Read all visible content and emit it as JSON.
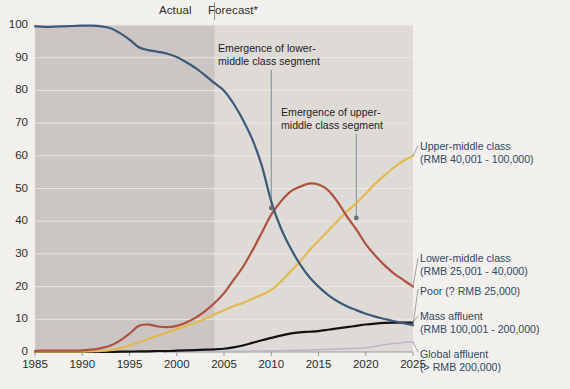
{
  "header": {
    "actual_label": "Actual",
    "forecast_label": "Forecast*"
  },
  "annotations": [
    {
      "id": "lower",
      "line1": "Emergence of lower-",
      "line2": "middle class segment"
    },
    {
      "id": "upper",
      "line1": "Emergence of upper-",
      "line2": "middle class segment"
    }
  ],
  "legend": {
    "upper_middle_l1": "Upper-middle class",
    "upper_middle_l2": "(RMB 40,001 - 100,000)",
    "lower_middle_l1": "Lower-middle class",
    "lower_middle_l2": "(RMB 25,001 - 40,000)",
    "poor_l1": "Poor (? RMB 25,000)",
    "mass_affluent_l1": "Mass affluent",
    "mass_affluent_l2": "(RMB 100,001 - 200,000)",
    "global_affluent_l1": "Global affluent",
    "global_affluent_l2": "(> RMB 200,000)"
  },
  "colors": {
    "poor": "#3c5a78",
    "lower_middle": "#b0503f",
    "upper_middle": "#e3b94e",
    "mass_affluent": "#121212",
    "global_affluent": "#b9b8c8",
    "page_bg": "#f2f0ec",
    "plot_bg": "#dedbd7",
    "actual_bg": "#cbc6c4",
    "grid": "#efece8"
  },
  "chart_data": {
    "type": "line",
    "title": "",
    "subtitle": "",
    "xlabel": "",
    "ylabel": "",
    "xlim": [
      1985,
      2025
    ],
    "ylim": [
      0,
      100
    ],
    "grid": true,
    "legend_position": "right",
    "xticks": [
      1985,
      1990,
      1995,
      2000,
      2005,
      2010,
      2015,
      2020,
      2025
    ],
    "yticks": [
      0,
      10,
      20,
      30,
      40,
      50,
      60,
      70,
      80,
      90,
      100
    ],
    "actual_forecast_split": 2004,
    "x": [
      1985,
      1986,
      1987,
      1988,
      1989,
      1990,
      1991,
      1992,
      1993,
      1994,
      1995,
      1996,
      1997,
      1998,
      1999,
      2000,
      2001,
      2002,
      2003,
      2004,
      2005,
      2006,
      2007,
      2008,
      2009,
      2010,
      2011,
      2012,
      2013,
      2014,
      2015,
      2016,
      2017,
      2018,
      2019,
      2020,
      2021,
      2022,
      2023,
      2024,
      2025
    ],
    "series": [
      {
        "name": "Poor (? RMB 25,000)",
        "color": "#3c5a78",
        "values": [
          99.6,
          99.4,
          99.5,
          99.6,
          99.7,
          99.8,
          99.8,
          99.6,
          99.0,
          97.5,
          95.5,
          93.2,
          92.3,
          91.8,
          91.2,
          90.2,
          88.6,
          86.8,
          84.6,
          82.2,
          79.9,
          76.0,
          71.0,
          65.0,
          57.0,
          46.0,
          38.0,
          32.0,
          27.0,
          23.0,
          20.0,
          17.5,
          15.5,
          14.0,
          12.8,
          11.7,
          10.8,
          10.1,
          9.4,
          8.8,
          8.2
        ]
      },
      {
        "name": "Lower-middle class (RMB 25,001 - 40,000)",
        "color": "#b0503f",
        "values": [
          0.3,
          0.4,
          0.4,
          0.4,
          0.4,
          0.5,
          0.7,
          1.2,
          2.0,
          3.5,
          5.6,
          8.0,
          8.4,
          7.8,
          7.6,
          8.0,
          9.0,
          10.5,
          12.5,
          15.0,
          18.0,
          22.0,
          26.0,
          31.0,
          36.5,
          42.0,
          46.0,
          49.0,
          50.5,
          51.5,
          51.2,
          49.5,
          46.0,
          41.5,
          37.5,
          33.0,
          29.5,
          26.5,
          24.0,
          22.0,
          20.0
        ]
      },
      {
        "name": "Upper-middle class (RMB 40,001 - 100,000)",
        "color": "#e3b94e",
        "values": [
          0.1,
          0.1,
          0.1,
          0.1,
          0.1,
          0.1,
          0.2,
          0.3,
          0.6,
          1.2,
          2.0,
          3.0,
          4.0,
          5.0,
          6.0,
          7.0,
          8.0,
          9.0,
          10.2,
          11.5,
          12.8,
          14.0,
          15.0,
          16.3,
          17.5,
          19.0,
          21.5,
          24.5,
          27.5,
          31.0,
          34.0,
          37.0,
          40.0,
          43.0,
          45.5,
          48.5,
          51.5,
          54.0,
          56.5,
          58.5,
          60.0
        ]
      },
      {
        "name": "Mass affluent (RMB 100,001 - 200,000)",
        "color": "#121212",
        "values": [
          0.0,
          0.0,
          0.0,
          0.0,
          0.0,
          0.0,
          0.0,
          0.0,
          0.0,
          0.1,
          0.1,
          0.2,
          0.2,
          0.3,
          0.3,
          0.4,
          0.5,
          0.6,
          0.7,
          0.8,
          1.0,
          1.4,
          2.0,
          2.8,
          3.6,
          4.3,
          5.0,
          5.6,
          6.0,
          6.2,
          6.4,
          6.8,
          7.2,
          7.6,
          8.0,
          8.4,
          8.7,
          8.9,
          9.0,
          9.0,
          9.0
        ]
      },
      {
        "name": "Global affluent (> RMB 200,000)",
        "color": "#b9b8c8",
        "values": [
          0.0,
          0.0,
          0.0,
          0.0,
          0.0,
          0.0,
          0.0,
          0.0,
          0.0,
          0.0,
          0.0,
          0.0,
          0.0,
          0.0,
          0.0,
          0.0,
          0.1,
          0.1,
          0.1,
          0.1,
          0.2,
          0.2,
          0.2,
          0.3,
          0.3,
          0.4,
          0.4,
          0.5,
          0.5,
          0.6,
          0.7,
          0.8,
          0.9,
          1.0,
          1.1,
          1.3,
          1.7,
          2.2,
          2.6,
          2.9,
          3.1
        ]
      }
    ],
    "markers": [
      {
        "x": 2010,
        "y": 44,
        "label": "Emergence of lower-middle class segment"
      },
      {
        "x": 2019,
        "y": 41,
        "label": "Emergence of upper-middle class segment"
      }
    ]
  }
}
